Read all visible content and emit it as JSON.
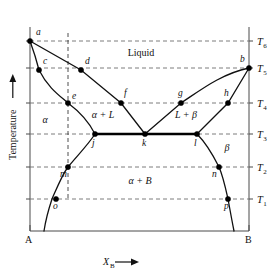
{
  "figure": {
    "kind": "binary-eutectic-phase-diagram",
    "y_axis_title": "Temperature",
    "y_axis_arrow": "up-arrow",
    "x_axis_title_main": "X",
    "x_axis_title_sub": "B",
    "x_axis_arrow": "right-arrow",
    "left_endpoint": "A",
    "right_endpoint": "B"
  },
  "temperatures": [
    {
      "id": "T6",
      "main": "T",
      "sub": "6",
      "y": 41
    },
    {
      "id": "T5",
      "main": "T",
      "sub": "5",
      "y": 68
    },
    {
      "id": "T4",
      "main": "T",
      "sub": "4",
      "y": 103
    },
    {
      "id": "T3",
      "main": "T",
      "sub": "3",
      "y": 134
    },
    {
      "id": "T2",
      "main": "T",
      "sub": "2",
      "y": 167
    },
    {
      "id": "T1",
      "main": "T",
      "sub": "1",
      "y": 199
    }
  ],
  "regions": [
    {
      "id": "liquid",
      "label": "Liquid",
      "italic": false,
      "x": 141,
      "y": 56
    },
    {
      "id": "alpha",
      "label": "α",
      "italic": true,
      "x": 45,
      "y": 123
    },
    {
      "id": "alpha-plus-L",
      "label": "α + L",
      "italic": true,
      "x": 103,
      "y": 118
    },
    {
      "id": "L-plus-beta",
      "label": "L + β",
      "italic": true,
      "x": 186,
      "y": 118
    },
    {
      "id": "beta",
      "label": "β",
      "italic": true,
      "x": 227,
      "y": 151
    },
    {
      "id": "alpha-plus-B",
      "label": "α + B",
      "italic": true,
      "x": 140,
      "y": 184
    }
  ],
  "points": [
    {
      "id": "a",
      "label": "a",
      "x": 30,
      "y": 41,
      "lx": 36,
      "ly": 35
    },
    {
      "id": "b",
      "label": "b",
      "x": 249,
      "y": 68,
      "lx": 240,
      "ly": 62
    },
    {
      "id": "c",
      "label": "c",
      "x": 39,
      "y": 70,
      "lx": 43,
      "ly": 64
    },
    {
      "id": "d",
      "label": "d",
      "x": 81,
      "y": 70,
      "lx": 85,
      "ly": 64
    },
    {
      "id": "e",
      "label": "e",
      "x": 68,
      "y": 103,
      "lx": 72,
      "ly": 99
    },
    {
      "id": "f",
      "label": "f",
      "x": 121,
      "y": 103,
      "lx": 124,
      "ly": 96
    },
    {
      "id": "g",
      "label": "g",
      "x": 181,
      "y": 103,
      "lx": 178,
      "ly": 96
    },
    {
      "id": "h",
      "label": "h",
      "x": 228,
      "y": 103,
      "lx": 224,
      "ly": 96
    },
    {
      "id": "j",
      "label": "j",
      "x": 95,
      "y": 134,
      "lx": 92,
      "ly": 146
    },
    {
      "id": "k",
      "label": "k",
      "x": 145,
      "y": 134,
      "lx": 142,
      "ly": 146
    },
    {
      "id": "l",
      "label": "l",
      "x": 197,
      "y": 134,
      "lx": 194,
      "ly": 146
    },
    {
      "id": "m",
      "label": "m",
      "x": 68,
      "y": 167,
      "lx": 60,
      "ly": 177
    },
    {
      "id": "n",
      "label": "n",
      "x": 219,
      "y": 167,
      "lx": 212,
      "ly": 177
    },
    {
      "id": "o",
      "label": "o",
      "x": 56,
      "y": 199,
      "lx": 53,
      "ly": 209
    },
    {
      "id": "p",
      "label": "p",
      "x": 228,
      "y": 199,
      "lx": 224,
      "ly": 209
    }
  ],
  "curves": {
    "liquidus_left": "M30,41 L81,70 L121,103 L145,134",
    "liquidus_right": "M249,68 C220,74 198,92 181,103 L145,134",
    "solvus_left_upper": "M30,41 C34,52 37,62 39,70 C48,88 60,96 68,103 C80,112 90,124 95,134",
    "solvus_left_lower": "M95,134 C88,145 76,157 68,167 C62,175 56,190 52,199 C49,208 46,218 44,231",
    "solidus_right_upper": "M249,68 L228,103 L197,134",
    "solidus_right_lower": "M197,134 C206,143 214,157 219,167 C223,176 226,190 228,199 C230,210 232,221 234,231"
  },
  "eutectic": {
    "path": "M95,134 L197,134"
  },
  "vertical_dashed": {
    "path": "M68,33 L68,199"
  },
  "plot_box": {
    "left": 30,
    "right": 249,
    "top": 27,
    "bottom": 231
  }
}
